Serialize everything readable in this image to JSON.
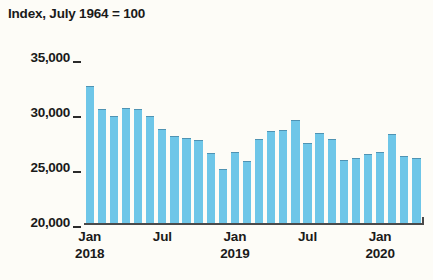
{
  "chart_data": {
    "type": "bar",
    "title": "Index, July 1964 = 100",
    "xlabel": "",
    "ylabel": "",
    "ylim": [
      20000,
      35000
    ],
    "ytick_values": [
      35000,
      30000,
      25000,
      20000
    ],
    "ytick_labels": [
      "35,000",
      "30,000",
      "25,000",
      "20,000"
    ],
    "grid": false,
    "legend": "none",
    "bar_color": "#6ec6e8",
    "bar_edge_color": "#4f93b3",
    "background_color": "#fdfcf7",
    "axis_color": "#4a4a4a",
    "text_color": "#1a1a1a",
    "xtick_labels": [
      {
        "month": "Jan",
        "year": "2018",
        "category": "2018-01"
      },
      {
        "month": "Jul",
        "year": "",
        "category": "2018-07"
      },
      {
        "month": "Jan",
        "year": "2019",
        "category": "2019-01"
      },
      {
        "month": "Jul",
        "year": "",
        "category": "2019-07"
      },
      {
        "month": "Jan",
        "year": "2020",
        "category": "2020-01"
      }
    ],
    "categories": [
      "2018-01",
      "2018-02",
      "2018-03",
      "2018-04",
      "2018-05",
      "2018-06",
      "2018-07",
      "2018-08",
      "2018-09",
      "2018-10",
      "2018-11",
      "2018-12",
      "2019-01",
      "2019-02",
      "2019-03",
      "2019-04",
      "2019-05",
      "2019-06",
      "2019-07",
      "2019-08",
      "2019-09",
      "2019-10",
      "2019-11",
      "2019-12",
      "2020-01",
      "2020-02",
      "2020-03",
      "2020-04"
    ],
    "values": [
      32450,
      30350,
      29750,
      30450,
      30350,
      29700,
      28550,
      27900,
      27700,
      27550,
      26400,
      24900,
      26500,
      25600,
      27650,
      28350,
      28450,
      29350,
      27300,
      28150,
      27650,
      25700,
      25900,
      26250,
      26450,
      28050,
      26100,
      25950
    ]
  }
}
